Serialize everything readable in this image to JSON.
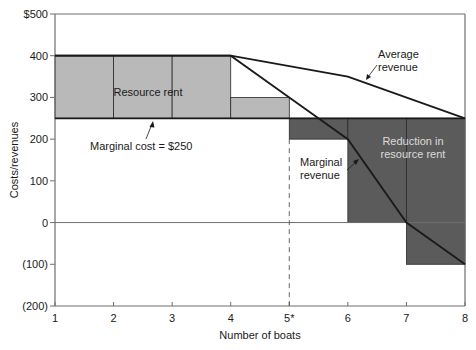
{
  "chart_data": {
    "type": "line",
    "title": "",
    "xlabel": "Number of boats",
    "ylabel": "Costs/revenues",
    "xlim": [
      1,
      8
    ],
    "ylim": [
      -200,
      500
    ],
    "x_ticks": [
      "1",
      "2",
      "3",
      "4",
      "5*",
      "6",
      "7",
      "8"
    ],
    "y_ticks": [
      {
        "value": 500,
        "label": "$500"
      },
      {
        "value": 400,
        "label": "400"
      },
      {
        "value": 300,
        "label": "300"
      },
      {
        "value": 200,
        "label": "200"
      },
      {
        "value": 100,
        "label": "100"
      },
      {
        "value": 0,
        "label": "0"
      },
      {
        "value": -100,
        "label": "(100)"
      },
      {
        "value": -200,
        "label": "(200)"
      }
    ],
    "grid": false,
    "series": [
      {
        "name": "Average revenue",
        "x": [
          1,
          4,
          6,
          8
        ],
        "y": [
          400,
          400,
          350,
          250
        ]
      },
      {
        "name": "Marginal revenue",
        "x": [
          1,
          4,
          5,
          6,
          7,
          8
        ],
        "y": [
          400,
          400,
          300,
          200,
          0,
          -100
        ]
      },
      {
        "name": "Marginal cost = $250",
        "x": [
          1,
          8
        ],
        "y": [
          250,
          250
        ]
      }
    ],
    "shaded_regions": [
      {
        "name": "Resource rent",
        "shade": "light",
        "bars": [
          {
            "x0": 1,
            "x1": 2,
            "y0": 250,
            "y1": 400
          },
          {
            "x0": 2,
            "x1": 3,
            "y0": 250,
            "y1": 400
          },
          {
            "x0": 3,
            "x1": 4,
            "y0": 250,
            "y1": 400
          },
          {
            "x0": 4,
            "x1": 5,
            "y0": 250,
            "y1": 300
          }
        ]
      },
      {
        "name": "Reduction in resource rent",
        "shade": "dark",
        "bars": [
          {
            "x0": 5,
            "x1": 6,
            "y0": 200,
            "y1": 250
          },
          {
            "x0": 6,
            "x1": 7,
            "y0": 0,
            "y1": 250
          },
          {
            "x0": 7,
            "x1": 8,
            "y0": -100,
            "y1": 250
          }
        ]
      }
    ],
    "optimum_marker": {
      "x": 5,
      "label": "5*",
      "style": "dashed"
    },
    "annotations": [
      {
        "text": "Resource rent",
        "x": 2.6,
        "y": 330
      },
      {
        "text": "Marginal cost = $250",
        "x": 2.5,
        "y": 200
      },
      {
        "text": "Average revenue",
        "x": 7.0,
        "y": 440
      },
      {
        "text": "Marginal revenue",
        "x": 5.1,
        "y": 160
      },
      {
        "text": "Reduction in resource rent",
        "x": 7.1,
        "y": 210
      }
    ],
    "colors": {
      "light_fill": "#b9b9b9",
      "dark_fill": "#5b5b5b",
      "line": "#1a1a1a",
      "axis": "#6e6e6e"
    }
  },
  "labels": {
    "resource_rent": "Resource rent",
    "marginal_cost": "Marginal cost = $250",
    "average_revenue_1": "Average",
    "average_revenue_2": "revenue",
    "marginal_revenue_1": "Marginal",
    "marginal_revenue_2": "revenue",
    "reduction_1": "Reduction in",
    "reduction_2": "resource rent",
    "xlabel": "Number of boats",
    "ylabel": "Costs/revenues"
  }
}
